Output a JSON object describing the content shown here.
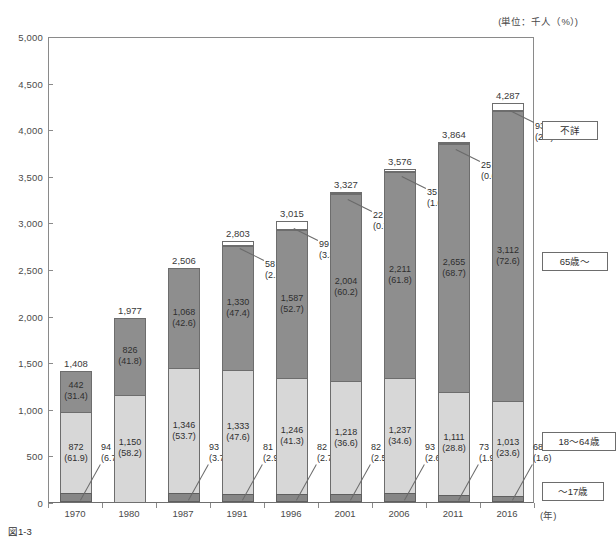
{
  "unit_note": "(単位：千人（%）)",
  "caption": "図1-3",
  "axis": {
    "x_unit": "(年)",
    "y_ticks": [
      "5,000",
      "4,500",
      "4,000",
      "3,500",
      "3,000",
      "2,500",
      "2,000",
      "1,500",
      "1,000",
      "500",
      "0"
    ]
  },
  "legend": [
    {
      "key": "unknown",
      "label": "不詳"
    },
    {
      "key": "old",
      "label": "65歳〜"
    },
    {
      "key": "adult",
      "label": "18〜64歳"
    },
    {
      "key": "child",
      "label": "〜17歳"
    }
  ],
  "colors": {
    "unknown": "#ffffff",
    "old": "#8e8e8e",
    "adult": "#d7d7d7",
    "child": "#868686",
    "axis": "#8a8a8a",
    "text": "#2f2f2f"
  },
  "chart_data": {
    "type": "bar",
    "title": "",
    "subtitle": "",
    "xlabel": "(年)",
    "ylabel": "",
    "ylim": [
      0,
      5000
    ],
    "ytick_step": 500,
    "grid": false,
    "stacked": true,
    "legend_position": "right",
    "unit": "千人（%）",
    "categories": [
      "1970",
      "1980",
      "1987",
      "1991",
      "1996",
      "2001",
      "2006",
      "2011",
      "2016"
    ],
    "totals": [
      1408,
      1977,
      2506,
      2803,
      3015,
      3327,
      3576,
      3864,
      4287
    ],
    "total_labels": [
      "1,408",
      "1,977",
      "2,506",
      "2,803",
      "3,015",
      "3,327",
      "3,576",
      "3,864",
      "4,287"
    ],
    "series": [
      {
        "name": "不詳",
        "key": "unknown",
        "values": [
          0,
          0,
          0,
          58,
          99,
          22,
          35,
          25,
          93
        ],
        "percents": [
          null,
          null,
          null,
          2.1,
          3.3,
          0.7,
          1.0,
          0.6,
          2.2
        ],
        "labels": [
          "",
          "",
          "",
          "58",
          "99",
          "22",
          "35",
          "25",
          "93"
        ],
        "percent_labels": [
          "",
          "",
          "",
          "(2.1)",
          "(3.3)",
          "(0.7)",
          "(1.0)",
          "(0.6)",
          "(2.2)"
        ]
      },
      {
        "name": "65歳〜",
        "key": "old",
        "values": [
          442,
          826,
          1068,
          1330,
          1587,
          2004,
          2211,
          2655,
          3112
        ],
        "percents": [
          31.4,
          41.8,
          42.6,
          47.4,
          52.7,
          60.2,
          61.8,
          68.7,
          72.6
        ],
        "labels": [
          "442",
          "826",
          "1,068",
          "1,330",
          "1,587",
          "2,004",
          "2,211",
          "2,655",
          "3,112"
        ],
        "percent_labels": [
          "(31.4)",
          "(41.8)",
          "(42.6)",
          "(47.4)",
          "(52.7)",
          "(60.2)",
          "(61.8)",
          "(68.7)",
          "(72.6)"
        ]
      },
      {
        "name": "18〜64歳",
        "key": "adult",
        "values": [
          872,
          1150,
          1346,
          1333,
          1246,
          1218,
          1237,
          1111,
          1013
        ],
        "percents": [
          61.9,
          58.2,
          53.7,
          47.6,
          41.3,
          36.6,
          34.6,
          28.8,
          23.6
        ],
        "labels": [
          "872",
          "1,150",
          "1,346",
          "1,333",
          "1,246",
          "1,218",
          "1,237",
          "1,111",
          "1,013"
        ],
        "percent_labels": [
          "(61.9)",
          "(58.2)",
          "(53.7)",
          "(47.6)",
          "(41.3)",
          "(36.6)",
          "(34.6)",
          "(28.8)",
          "(23.6)"
        ]
      },
      {
        "name": "〜17歳",
        "key": "child",
        "values": [
          94,
          0,
          93,
          81,
          82,
          82,
          93,
          73,
          68
        ],
        "percents": [
          6.7,
          null,
          3.7,
          2.9,
          2.7,
          2.5,
          2.6,
          1.9,
          1.6
        ],
        "labels": [
          "94",
          "",
          "93",
          "81",
          "82",
          "82",
          "93",
          "73",
          "68"
        ],
        "percent_labels": [
          "(6.7)",
          "",
          "(3.7)",
          "(2.9)",
          "(2.7)",
          "(2.5)",
          "(2.6)",
          "(1.9)",
          "(1.6)"
        ]
      }
    ]
  }
}
